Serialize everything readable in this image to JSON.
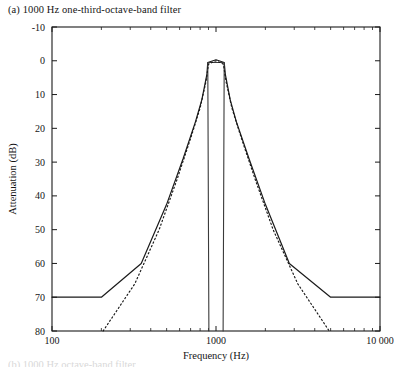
{
  "figure": {
    "caption_a": "(a) 1000 Hz one-third-octave-band filter",
    "caption_b_partial": "(b) 1000 Hz octave-band filter"
  },
  "chart_data": {
    "type": "line",
    "title": "(a) 1000 Hz one-third-octave-band filter",
    "xlabel": "Frequency (Hz)",
    "ylabel": "Attenuation (dB)",
    "xscale": "log",
    "xlim": [
      100,
      10000
    ],
    "ylim": [
      -10,
      80
    ],
    "y_inverted": true,
    "grid": false,
    "legend": null,
    "xticks": [
      100,
      1000,
      10000
    ],
    "xtick_labels": [
      "100",
      "1000",
      "10 000"
    ],
    "yticks": [
      -10,
      0,
      10,
      20,
      30,
      40,
      50,
      60,
      70,
      80
    ],
    "ytick_labels": [
      "-10",
      "0",
      "10",
      "20",
      "30",
      "40",
      "50",
      "60",
      "70",
      "80"
    ],
    "xminor_ticks": [
      200,
      300,
      400,
      500,
      600,
      700,
      800,
      900,
      2000,
      3000,
      4000,
      5000,
      6000,
      7000,
      8000,
      9000
    ],
    "series": [
      {
        "name": "Type 1 tolerance limit (upper)",
        "style": "solid",
        "color": "#1a1a1a",
        "width": 1.2,
        "points": [
          [
            100,
            70.0
          ],
          [
            200,
            70.0
          ],
          [
            350,
            60.0
          ],
          [
            500,
            42.5
          ],
          [
            630,
            29.0
          ],
          [
            750,
            18.0
          ],
          [
            820,
            11.5
          ],
          [
            880,
            4.0
          ],
          [
            891,
            0.5
          ],
          [
            1000,
            -0.3
          ],
          [
            1122,
            0.5
          ],
          [
            1140,
            4.0
          ],
          [
            1220,
            11.5
          ],
          [
            1330,
            18.0
          ],
          [
            1590,
            29.0
          ],
          [
            2000,
            42.5
          ],
          [
            2800,
            60.0
          ],
          [
            5000,
            70.0
          ],
          [
            10000,
            70.0
          ]
        ]
      },
      {
        "name": "Ideal filter band edges",
        "style": "solid",
        "color": "#3a3a3a",
        "width": 1.1,
        "points": [
          [
            905,
            80.0
          ],
          [
            891,
            0.0
          ],
          [
            1000,
            0.0
          ],
          [
            1122,
            0.0
          ],
          [
            1105,
            80.0
          ]
        ],
        "segments": [
          [
            [
              905,
              80.0
            ],
            [
              891,
              0.5
            ],
            [
              1122,
              0.5
            ],
            [
              1105,
              80.0
            ]
          ]
        ]
      },
      {
        "name": "Type 0 tolerance limit (lower / dotted)",
        "style": "dotted",
        "color": "#1a1a1a",
        "width": 1.2,
        "points": [
          [
            205,
            80.0
          ],
          [
            320,
            66.0
          ],
          [
            450,
            50.0
          ],
          [
            580,
            35.0
          ],
          [
            700,
            23.0
          ],
          [
            800,
            14.0
          ],
          [
            870,
            6.0
          ],
          [
            900,
            1.0
          ],
          [
            1000,
            0.0
          ],
          [
            1110,
            1.0
          ],
          [
            1150,
            6.0
          ],
          [
            1250,
            14.0
          ],
          [
            1430,
            23.0
          ],
          [
            1730,
            35.0
          ],
          [
            2230,
            50.0
          ],
          [
            3150,
            66.0
          ],
          [
            4900,
            80.0
          ]
        ]
      }
    ],
    "annotations": []
  },
  "axes_geometry": {
    "left_px": 52,
    "right_px": 380,
    "top_px": 27,
    "bottom_px": 331
  }
}
